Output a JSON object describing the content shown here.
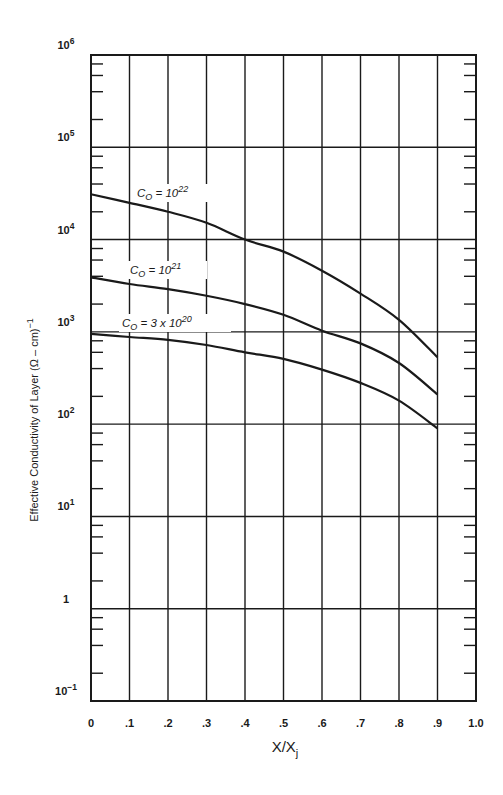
{
  "chart_data": {
    "type": "line",
    "title": "",
    "xlabel": "X/Xj",
    "xlabel_main": "X/X",
    "xlabel_sub": "j",
    "ylabel": "Effective Conductivity of Layer (Ω – cm)⁻¹",
    "ylabel_main": "Effective Conductivity of Layer (Ω – cm)",
    "ylabel_sup": "−1",
    "yscale": "log",
    "xlim": [
      0,
      1.0
    ],
    "ylim": [
      0.1,
      1000000
    ],
    "grid": true,
    "x_ticks": [
      "0",
      ".1",
      ".2",
      ".3",
      ".4",
      ".5",
      ".6",
      ".7",
      ".8",
      ".9",
      "1.0"
    ],
    "y_ticks": [
      {
        "base": "10",
        "exp": "6",
        "value": 1000000
      },
      {
        "base": "10",
        "exp": "5",
        "value": 100000
      },
      {
        "base": "10",
        "exp": "4",
        "value": 10000
      },
      {
        "base": "10",
        "exp": "3",
        "value": 1000
      },
      {
        "base": "10",
        "exp": "2",
        "value": 100
      },
      {
        "base": "10",
        "exp": "1",
        "value": 10
      },
      {
        "base": "1",
        "exp": "",
        "value": 1
      },
      {
        "base": "10",
        "exp": "−1",
        "value": 0.1
      }
    ],
    "x": [
      0,
      0.1,
      0.2,
      0.3,
      0.4,
      0.5,
      0.6,
      0.7,
      0.8,
      0.9
    ],
    "series": [
      {
        "name": "Co = 10^22",
        "label_prefix": "C",
        "label_sub": "O",
        "label_eq": " = ",
        "label_base": "10",
        "label_exp": "22",
        "values": [
          31000,
          25000,
          20000,
          15200,
          10000,
          7400,
          4600,
          2600,
          1350,
          530
        ]
      },
      {
        "name": "Co = 10^21",
        "label_prefix": "C",
        "label_sub": "O",
        "label_eq": " = ",
        "label_base": "10",
        "label_exp": "21",
        "values": [
          3900,
          3300,
          2900,
          2460,
          2000,
          1530,
          1030,
          750,
          460,
          210
        ]
      },
      {
        "name": "Co = 3 x 10^20",
        "label_prefix": "C",
        "label_sub": "O",
        "label_eq": " = 3 x ",
        "label_base": "10",
        "label_exp": "20",
        "values": [
          950,
          880,
          820,
          720,
          600,
          510,
          390,
          280,
          180,
          90
        ]
      }
    ],
    "legend": "inline curve labels"
  },
  "colors": {
    "ink": "#1a1a1a",
    "background": "#ffffff"
  }
}
